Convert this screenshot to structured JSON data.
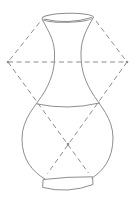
{
  "colors": {
    "line": "#8e8e8e",
    "background": "#ffffff"
  },
  "construction": {
    "dash_pattern": "5 3.5",
    "dot_radius": 1.3,
    "vertices": {
      "left": [
        8,
        62
      ],
      "right": [
        127,
        62
      ],
      "center_cross": [
        68,
        144
      ]
    },
    "lines": [
      {
        "name": "diamond-upper-left-edge",
        "from": [
          39.5,
          22.5
        ],
        "to": [
          8,
          62
        ]
      },
      {
        "name": "diamond-upper-right-edge",
        "from": [
          96,
          21
        ],
        "to": [
          127,
          62
        ]
      },
      {
        "name": "horizontal-axis-line",
        "from": [
          8,
          62
        ],
        "to": [
          127,
          62
        ]
      },
      {
        "name": "left-diagonal-line",
        "from": [
          8,
          62
        ],
        "to": [
          88.5,
          173
        ]
      },
      {
        "name": "right-diagonal-line",
        "from": [
          127,
          62
        ],
        "to": [
          47.5,
          173.5
        ]
      }
    ],
    "dots": [
      {
        "name": "left-vertex-dot",
        "at": [
          8,
          62
        ]
      },
      {
        "name": "right-vertex-dot",
        "at": [
          127,
          62
        ]
      },
      {
        "name": "center-cross-dot",
        "at": [
          68,
          144
        ]
      }
    ]
  }
}
